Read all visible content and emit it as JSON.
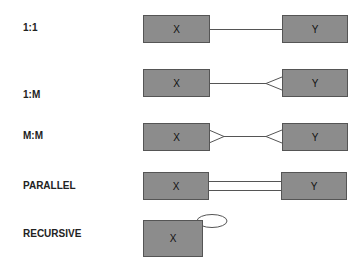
{
  "diagram": {
    "rows": [
      {
        "label": "1:1",
        "left": "X",
        "right": "Y",
        "type": "one-to-one"
      },
      {
        "label": "1:M",
        "left": "X",
        "right": "Y",
        "type": "one-to-many"
      },
      {
        "label": "M:M",
        "left": "X",
        "right": "Y",
        "type": "many-to-many"
      },
      {
        "label": "PARALLEL",
        "left": "X",
        "right": "Y",
        "type": "parallel"
      },
      {
        "label": "RECURSIVE",
        "left": "X",
        "type": "recursive"
      }
    ],
    "colors": {
      "box_fill": "#8c8c8c",
      "box_border": "#555555",
      "line": "#555555"
    }
  }
}
